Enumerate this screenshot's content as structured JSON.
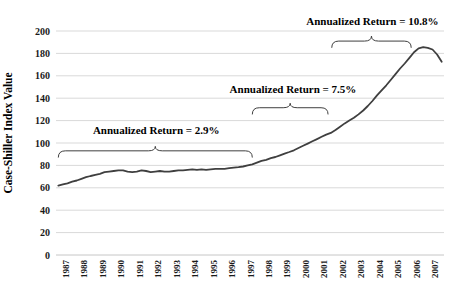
{
  "chart_data": {
    "type": "line",
    "title": "",
    "ylabel": "Case-Shiller Index Value",
    "xlabel": "",
    "ylim": [
      0,
      200
    ],
    "yticks": [
      0,
      20,
      40,
      60,
      80,
      100,
      120,
      140,
      160,
      180,
      200
    ],
    "grid": "horizontal",
    "legend": "none",
    "x_years": [
      "1987",
      "1988",
      "1989",
      "1990",
      "1991",
      "1992",
      "1993",
      "1994",
      "1995",
      "1996",
      "1997",
      "1998",
      "1999",
      "2000",
      "2001",
      "2002",
      "2003",
      "2004",
      "2005",
      "2006",
      "2007"
    ],
    "x_frequency": "quarterly",
    "series": [
      {
        "name": "Case-Shiller Index Value",
        "values": [
          62,
          63,
          64,
          65.5,
          66.5,
          68,
          69.5,
          70.5,
          71.5,
          72.5,
          74,
          74.5,
          75,
          75.5,
          75.5,
          74.5,
          74,
          74.5,
          75.5,
          75,
          74,
          74.5,
          75,
          74.5,
          74.5,
          75,
          75.5,
          75.5,
          76,
          76.5,
          76,
          76.5,
          76,
          76.5,
          77,
          77,
          77,
          77.5,
          78,
          78.5,
          79,
          80,
          81,
          82.5,
          84,
          85,
          86.5,
          87.5,
          89,
          90.5,
          92,
          93.5,
          95.5,
          97.5,
          99.5,
          101.5,
          103.5,
          105.5,
          107.5,
          109,
          111.5,
          114.5,
          117.5,
          120,
          122.5,
          125.5,
          129,
          133,
          137.5,
          142.5,
          147,
          151.5,
          156.5,
          161.5,
          166.5,
          171,
          176,
          181,
          184.5,
          185.5,
          185,
          183.5,
          179,
          172.5
        ]
      }
    ],
    "annotations": [
      {
        "label": "Annualized Return = 2.9%",
        "text_year": 1992.3,
        "text_value": 112,
        "brace": {
          "start_year": 1987.0,
          "end_year": 1997.5,
          "peak_value": 97,
          "line_value": 93,
          "end_value": 87
        }
      },
      {
        "label": "Annualized Return = 7.5%",
        "text_year": 1999.7,
        "text_value": 148.5,
        "brace": {
          "start_year": 1997.5,
          "end_year": 2001.6,
          "peak_value": 135.5,
          "line_value": 131.5,
          "end_value": 125.5
        }
      },
      {
        "label": "Annualized Return = 10.8%",
        "text_year": 2004.0,
        "text_value": 209,
        "brace": {
          "start_year": 2001.8,
          "end_year": 2006.1,
          "peak_value": 195.5,
          "line_value": 191,
          "end_value": 185
        }
      }
    ],
    "colors": {
      "line": "#3f3f3f",
      "gridline": "#d9d9d9",
      "axis": "#c6c6c6",
      "text": "#1a1a1a"
    }
  }
}
